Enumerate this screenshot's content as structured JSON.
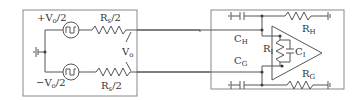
{
  "diagram": {
    "type": "circuit-schematic",
    "left_block": {
      "name": "differential-source",
      "top_source_label": "+V",
      "top_source_sub": "o",
      "top_source_suffix": "/2",
      "bottom_source_label": "−V",
      "bottom_source_sub": "o",
      "bottom_source_suffix": "/2",
      "top_resistor_label": "R",
      "top_resistor_sub": "s",
      "top_resistor_suffix": "/2",
      "bottom_resistor_label": "R",
      "bottom_resistor_sub": "s",
      "bottom_resistor_suffix": "/2",
      "output_label": "V",
      "output_sub": "o"
    },
    "right_block": {
      "name": "amplifier-input-model",
      "ch_label": "C",
      "ch_sub": "H",
      "cg_label": "C",
      "cg_sub": "G",
      "ri_label": "R",
      "ri_sub": "I",
      "ci_label": "C",
      "ci_sub": "I",
      "rh_label": "R",
      "rh_sub": "H",
      "rg_label": "R",
      "rg_sub": "G"
    },
    "colors": {
      "line": "#555555",
      "box": "#888888",
      "text": "#333333"
    }
  }
}
